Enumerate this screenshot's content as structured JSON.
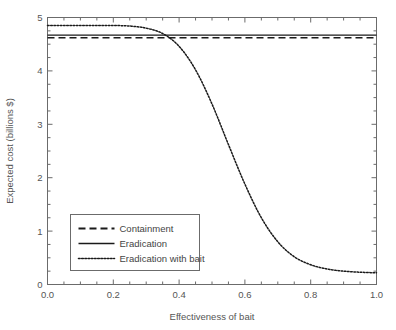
{
  "chart_data": {
    "type": "line",
    "title": "",
    "xlabel": "Effectiveness of bait",
    "ylabel": "Expected cost (billions $)",
    "xlim": [
      0.0,
      1.0
    ],
    "ylim": [
      0,
      5
    ],
    "xticks": [
      0.0,
      0.2,
      0.4,
      0.6,
      0.8,
      1.0
    ],
    "xtick_labels": [
      "0.0",
      "0.2",
      "0.4",
      "0.6",
      "0.8",
      "1.0"
    ],
    "yticks": [
      0,
      1,
      2,
      3,
      4,
      5
    ],
    "ytick_labels": [
      "0",
      "1",
      "2",
      "3",
      "4",
      "5"
    ],
    "x_minor_step": 0.05,
    "y_minor_step": 0.25,
    "grid": false,
    "legend_position": "center-left",
    "series": [
      {
        "name": "Containment",
        "style": "dashed",
        "color": "#1a1a1a",
        "x": [
          0.0,
          0.1,
          0.2,
          0.3,
          0.4,
          0.5,
          0.6,
          0.7,
          0.8,
          0.9,
          1.0
        ],
        "values": [
          4.62,
          4.62,
          4.62,
          4.62,
          4.62,
          4.62,
          4.62,
          4.62,
          4.62,
          4.62,
          4.62
        ]
      },
      {
        "name": "Eradication",
        "style": "solid",
        "color": "#1a1a1a",
        "x": [
          0.0,
          0.1,
          0.2,
          0.3,
          0.4,
          0.5,
          0.6,
          0.7,
          0.8,
          0.9,
          1.0
        ],
        "values": [
          4.67,
          4.67,
          4.67,
          4.67,
          4.67,
          4.67,
          4.67,
          4.67,
          4.67,
          4.67,
          4.67
        ]
      },
      {
        "name": "Eradication with bait",
        "style": "dotted",
        "color": "#1a1a1a",
        "x": [
          0.0,
          0.05,
          0.1,
          0.15,
          0.2,
          0.25,
          0.3,
          0.35,
          0.4,
          0.45,
          0.5,
          0.55,
          0.6,
          0.65,
          0.7,
          0.75,
          0.8,
          0.85,
          0.9,
          0.95,
          1.0
        ],
        "values": [
          4.85,
          4.85,
          4.85,
          4.85,
          4.85,
          4.84,
          4.8,
          4.7,
          4.46,
          4.02,
          3.38,
          2.62,
          1.88,
          1.25,
          0.8,
          0.52,
          0.37,
          0.29,
          0.25,
          0.23,
          0.22
        ]
      }
    ]
  },
  "legend": {
    "items": [
      {
        "label": "Containment"
      },
      {
        "label": "Eradication"
      },
      {
        "label": "Eradication with bait"
      }
    ]
  },
  "axes": {
    "x_label": "Effectiveness of bait",
    "y_label": "Expected cost (billions $)"
  }
}
